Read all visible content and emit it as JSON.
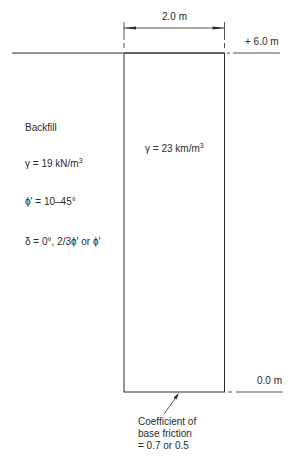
{
  "dimensions": {
    "width_label": "2.0 m",
    "top_level": "+ 6.0 m",
    "bottom_level": "0.0 m"
  },
  "backfill": {
    "title": "Backfill",
    "unit_weight": "γ = 19 kN/m",
    "unit_weight_exp": "3",
    "friction_angle": "ϕ' = 10–45°",
    "wall_friction": "δ = 0°, 2/3ϕ' or ϕ'"
  },
  "wall": {
    "unit_weight": "γ = 23 km/m",
    "unit_weight_exp": "3"
  },
  "base_note": {
    "line1": "Coefficient of",
    "line2": "base friction",
    "line3": "= 0.7 or 0.5"
  },
  "colors": {
    "line": "#2a2a2a",
    "background": "#ffffff"
  }
}
